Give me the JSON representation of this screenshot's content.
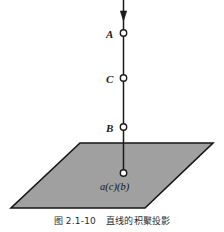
{
  "figure": {
    "caption_number": "图 2.1-10",
    "caption_text": "直线的积聚投影",
    "colors": {
      "plane_fill": "#a0a0a0",
      "plane_stroke": "#161616",
      "line_stroke": "#1a1a1a",
      "marker_fill": "#ffffff",
      "marker_stroke": "#1a1a1a",
      "text": "#1a1a1a",
      "background": "#ffffff"
    },
    "line": {
      "name": "vertical-projection-line",
      "x": 123.5,
      "y_top": 0,
      "y_bottom": 173,
      "arrow_y": 20,
      "arrow_direction": "down"
    },
    "plane": {
      "name": "horizontal-projection-plane",
      "points": "80,143 213,143 145,208 11,208"
    },
    "points": [
      {
        "id": "A",
        "label": "A",
        "marker_x": 123.5,
        "marker_y": 33,
        "label_x": 106,
        "label_y": 29
      },
      {
        "id": "C",
        "label": "C",
        "marker_x": 123.5,
        "marker_y": 78,
        "label_x": 106,
        "label_y": 74
      },
      {
        "id": "B",
        "label": "B",
        "marker_x": 123.5,
        "marker_y": 127,
        "label_x": 106,
        "label_y": 123
      }
    ],
    "projection_point": {
      "id": "acb",
      "label": "a(c)(b)",
      "marker_x": 123.5,
      "marker_y": 173,
      "label_x": 100,
      "label_y": 182
    }
  }
}
